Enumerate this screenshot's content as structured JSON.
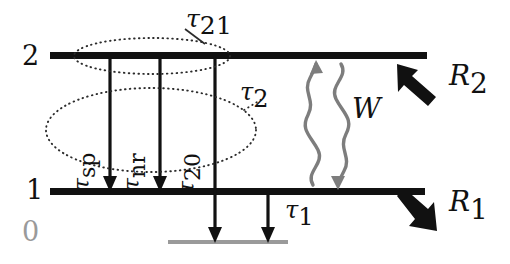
{
  "figure": {
    "kind": "energy-level-diagram",
    "background_color": "#ffffff",
    "ink_color": "#111111",
    "faded_color": "#9a9a9a",
    "squiggle_color": "#7d7d7d"
  },
  "levels": [
    {
      "id": "level-2",
      "label": "2",
      "style": "solid-black",
      "color": "#111111",
      "y": 57,
      "x_start": 50,
      "x_end": 427
    },
    {
      "id": "level-1",
      "label": "1",
      "style": "solid-black",
      "color": "#111111",
      "y": 192,
      "x_start": 50,
      "x_end": 425
    },
    {
      "id": "level-0",
      "label": "0",
      "style": "thin-gray",
      "color": "#9a9a9a",
      "y": 243,
      "x_start": 168,
      "x_end": 288
    }
  ],
  "transitions": [
    {
      "id": "tau-sp",
      "label": "τ",
      "subscript": "sp",
      "from_level": "2",
      "to_level": "1",
      "arrow": "down",
      "x": 110,
      "label_orientation": "vertical"
    },
    {
      "id": "tau-nr",
      "label": "τ",
      "subscript": "nr",
      "from_level": "2",
      "to_level": "1",
      "arrow": "down",
      "x": 160,
      "label_orientation": "vertical"
    },
    {
      "id": "tau-20",
      "label": "τ",
      "subscript": "20",
      "from_level": "2",
      "to_level": "0",
      "arrow": "down",
      "x": 215,
      "label_orientation": "vertical"
    },
    {
      "id": "tau-1",
      "label": "τ",
      "subscript": "1",
      "from_level": "1",
      "to_level": "0",
      "arrow": "down",
      "x": 268,
      "label_orientation": "horizontal"
    }
  ],
  "groupings": [
    {
      "id": "tau-21-group",
      "label": "τ",
      "subscript": "21",
      "shape": "dotted-ellipse",
      "encloses": [
        "tau-sp",
        "tau-nr"
      ],
      "cx": 152,
      "cy": 56,
      "rx": 78,
      "ry": 18,
      "leader_from": [
        205,
        44
      ],
      "leader_to": [
        183,
        30
      ],
      "label_x": 188,
      "label_y": 8
    },
    {
      "id": "tau-2-group",
      "label": "τ",
      "subscript": "2",
      "shape": "dotted-ellipse",
      "encloses": [
        "tau-sp",
        "tau-nr",
        "tau-20"
      ],
      "cx": 151,
      "cy": 130,
      "rx": 105,
      "ry": 42,
      "leader_from": [
        243,
        113
      ],
      "leader_to": [
        258,
        101
      ],
      "label_x": 243,
      "label_y": 82
    }
  ],
  "pump_transition": {
    "id": "W-transition",
    "label": "W",
    "style": "wavy-double-arrow",
    "color": "#7d7d7d",
    "up_arrow_x": 315,
    "down_arrow_x": 340,
    "top_y": 60,
    "bottom_y": 190,
    "label_x": 353,
    "label_y": 99
  },
  "pump_rates": [
    {
      "id": "R2",
      "label": "R",
      "subscript": "2",
      "arrow_direction": "up-left",
      "arrow_tail": [
        432,
        96
      ],
      "arrow_tip": [
        398,
        66
      ],
      "label_x": 452,
      "label_y": 68
    },
    {
      "id": "R1",
      "label": "R",
      "subscript": "1",
      "arrow_direction": "down-right",
      "arrow_tail": [
        398,
        196
      ],
      "arrow_tip": [
        434,
        230
      ],
      "label_x": 452,
      "label_y": 193
    }
  ],
  "level_labels": [
    {
      "id": "num-2",
      "text": "2",
      "x": 22,
      "y": 42,
      "color": "#111111"
    },
    {
      "id": "num-1",
      "text": "1",
      "x": 26,
      "y": 178,
      "color": "#111111"
    },
    {
      "id": "num-0",
      "text": "0",
      "x": 22,
      "y": 220,
      "color": "#9a9a9a"
    }
  ]
}
